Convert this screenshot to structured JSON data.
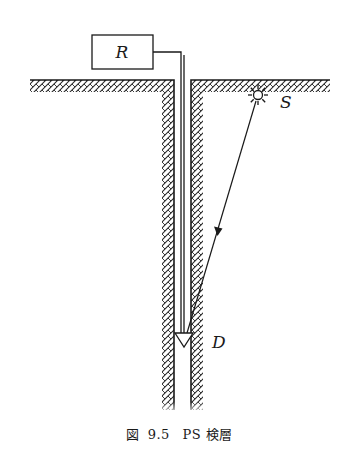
{
  "figure": {
    "caption": {
      "prefix": "図",
      "number": "9.5",
      "title": "PS 検層"
    },
    "labels": {
      "receiver": "R",
      "source": "S",
      "detector": "D"
    },
    "colors": {
      "line": "#1a1a1a",
      "hatch": "#2a2a2a",
      "background": "#ffffff"
    },
    "elements": [
      {
        "id": "receiver-box",
        "desc": "Recorder box R at surface connected by cable"
      },
      {
        "id": "ground-surface",
        "desc": "Hatched ground surface with borehole"
      },
      {
        "id": "borehole",
        "desc": "Vertical borehole with hatched walls"
      },
      {
        "id": "cable",
        "desc": "Cable from R down borehole to detector D"
      },
      {
        "id": "source",
        "desc": "Star-shaped seismic source S at surface"
      },
      {
        "id": "ray-path",
        "desc": "Wave ray from S to D with arrow"
      },
      {
        "id": "detector",
        "desc": "Downward triangle detector D in borehole"
      }
    ]
  }
}
